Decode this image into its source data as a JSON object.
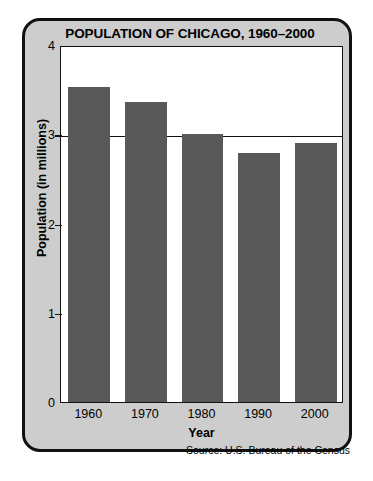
{
  "chart_data": {
    "type": "bar",
    "title": "POPULATION OF CHICAGO, 1960–2000",
    "categories": [
      "1960",
      "1970",
      "1980",
      "1990",
      "2000"
    ],
    "values": [
      3.53,
      3.36,
      3.0,
      2.79,
      2.9
    ],
    "xlabel": "Year",
    "ylabel": "Population (in millions)",
    "ylim": [
      0,
      4
    ],
    "yticks": [
      "0",
      "1",
      "2",
      "3",
      "4"
    ],
    "ytick_values": [
      0,
      1,
      2,
      3,
      4
    ],
    "gridlines_at": [
      3
    ],
    "grid": true,
    "legend": "none",
    "source": "Source: U.S. Bureau of the Census",
    "bar_color": "#595959",
    "plot_background": "#ffffff",
    "card_background": "#cdcdcd",
    "axis_color": "#111111"
  },
  "page": {
    "artifact_text": ""
  }
}
